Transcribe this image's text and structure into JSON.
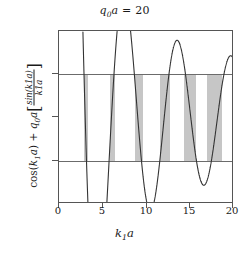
{
  "chart_data": {
    "type": "line",
    "title": "q0a = 20",
    "title_parts": {
      "sym": "q",
      "sub": "0",
      "var": "a",
      "eq": "=",
      "value": "20"
    },
    "xlabel": "k1a",
    "xlabel_parts": {
      "sym": "k",
      "sub": "1",
      "var": "a"
    },
    "ylabel": "cos(k1a) + q0a[sin(k1a)/(k1a)]",
    "ylabel_parts": {
      "cos": "cos(",
      "k": "k",
      "ksub": "1",
      "a": "a",
      "close": ")",
      "plus": "+",
      "q": "q",
      "qsub": "0",
      "qa": "a",
      "bracket_open": "[",
      "bracket_close": "]",
      "numerator": "sin(k1a)",
      "denominator": "k1a"
    },
    "xlim": [
      0,
      20
    ],
    "ylim": [
      -2,
      2
    ],
    "xticks": [
      0,
      5,
      10,
      15,
      20
    ],
    "yticks": [
      2,
      1,
      0,
      -1,
      -2
    ],
    "xtick_labels": [
      "0",
      "5",
      "10",
      "15",
      "20"
    ],
    "ytick_labels": [
      "2",
      "1",
      "0",
      "-1",
      "-2"
    ],
    "grid": false,
    "legend": "none",
    "reference_lines": [
      1,
      -1
    ],
    "parameters": {
      "q0a": 20
    },
    "function": "cos(k1a) + 20*sin(k1a)/(k1a)",
    "allowed_bands": [
      {
        "start": 2.88,
        "end": 3.28
      },
      {
        "start": 5.8,
        "end": 6.45
      },
      {
        "start": 8.67,
        "end": 9.58
      },
      {
        "start": 11.49,
        "end": 12.66
      },
      {
        "start": 14.24,
        "end": 15.68
      },
      {
        "start": 16.9,
        "end": 18.65
      }
    ],
    "curve_extrema": [
      {
        "x": 13.4,
        "y": 1.8
      },
      {
        "x": 16.7,
        "y": -1.55
      },
      {
        "x": 19.8,
        "y": 1.45
      }
    ],
    "series": [
      {
        "name": "cos(k1a) + q0a sin(k1a)/(k1a)",
        "color": "#333333"
      }
    ],
    "colors": {
      "curve": "#333333",
      "band_fill": "#c6c6c6",
      "reference_line": "#6b6b6b",
      "axis": "#555555",
      "background": "#ffffff"
    }
  }
}
